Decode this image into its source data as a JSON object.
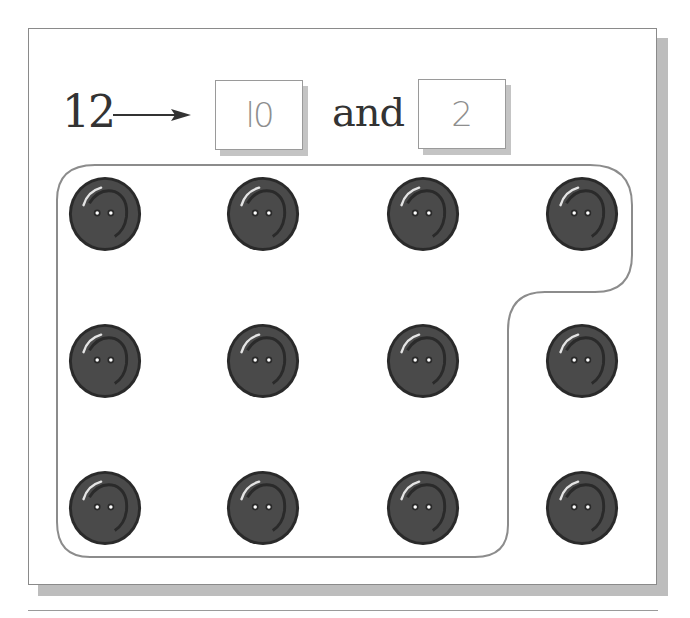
{
  "equation": {
    "total": "12",
    "arrow": "→",
    "tens_value": "10",
    "tens_display": "l0",
    "conjunction": "and",
    "ones_value": "2"
  },
  "colors": {
    "panel_border": "#8a8a8a",
    "panel_shadow": "#bdbdbd",
    "outline": "#8c8c8c",
    "button_fill": "#4a4a4a",
    "button_rim": "#2a2a2a",
    "box_text": "#8e8e8e",
    "text": "#333333"
  },
  "buttons": {
    "total_count": 12,
    "grouped_count": 10,
    "ungrouped_count": 2,
    "grid": {
      "rows": 3,
      "cols": 4
    },
    "centers_x": [
      105,
      263,
      423,
      582
    ],
    "centers_y": [
      213,
      360,
      507
    ],
    "icon": "button-icon"
  }
}
